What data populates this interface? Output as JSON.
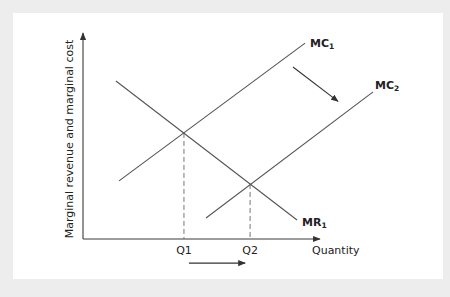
{
  "chart_data": {
    "type": "line",
    "title": "",
    "xlabel": "Quantity",
    "ylabel": "Marginal revenue and marginal cost",
    "xlim": [
      0,
      10
    ],
    "ylim": [
      0,
      10
    ],
    "grid": false,
    "series": [
      {
        "name": "MR1",
        "label_main": "MR",
        "label_sub": "1",
        "points": [
          [
            1.39,
            7.67
          ],
          [
            9.03,
            0.92
          ]
        ]
      },
      {
        "name": "MC1",
        "label_main": "MC",
        "label_sub": "1",
        "points": [
          [
            1.52,
            2.82
          ],
          [
            9.37,
            9.51
          ]
        ]
      },
      {
        "name": "MC2",
        "label_main": "MC",
        "label_sub": "2",
        "points": [
          [
            5.19,
            1.02
          ],
          [
            12.24,
            7.14
          ]
        ]
      }
    ],
    "equilibria": [
      {
        "name": "Q1",
        "label": "Q1",
        "x": 4.26,
        "y": 5.15
      },
      {
        "name": "Q2",
        "label": "Q2",
        "x": 7.05,
        "y": 2.67
      }
    ],
    "annotations": [
      {
        "name": "mc-shift-arrow",
        "description": "MC curve shifts down/right",
        "from": [
          8.86,
          8.35
        ],
        "to": [
          10.76,
          6.68
        ]
      },
      {
        "name": "quantity-shift-arrow",
        "description": "Quantity increases from Q1 to Q2",
        "from": [
          4.47,
          -1.17
        ],
        "to": [
          6.84,
          -1.17
        ]
      }
    ]
  }
}
